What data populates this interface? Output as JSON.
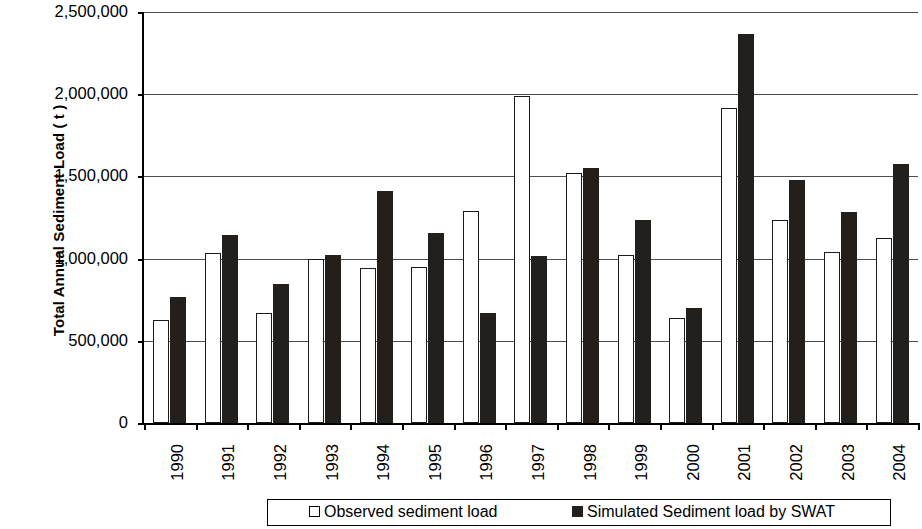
{
  "chart_data": {
    "type": "bar",
    "title": "",
    "subtitle": "",
    "xlabel": "",
    "ylabel": "Total Annual Sediment Load ( t )",
    "ylim": [
      0,
      2500000
    ],
    "ytick_values": [
      0,
      500000,
      1000000,
      1500000,
      2000000,
      2500000
    ],
    "ytick_labels": [
      "0",
      "500,000",
      "1,000,000",
      "1,500,000",
      "2,000,000",
      "2,500,000"
    ],
    "grid": "horizontal",
    "legend_position": "bottom",
    "categories": [
      "1990",
      "1991",
      "1992",
      "1993",
      "1994",
      "1995",
      "1996",
      "1997",
      "1998",
      "1999",
      "2000",
      "2001",
      "2002",
      "2003",
      "2004"
    ],
    "series": [
      {
        "name": "Observed sediment load",
        "color": "#ffffff",
        "edge_color": "#000000",
        "values": [
          627000,
          1035000,
          668000,
          1000000,
          943000,
          950000,
          1290000,
          1992000,
          1521000,
          1024000,
          641000,
          1917000,
          1233000,
          1041000,
          1127000
        ]
      },
      {
        "name": "Simulated Sediment load by SWAT",
        "color": "#231f1c",
        "edge_color": "#231f1c",
        "values": [
          764000,
          1141000,
          847000,
          1021000,
          1411000,
          1156000,
          672000,
          1018000,
          1553000,
          1232000,
          702000,
          2368000,
          1480000,
          1282000,
          1574000
        ]
      }
    ]
  },
  "legend": {
    "items": [
      {
        "label": "Observed sediment load",
        "marker": "open-square-marker"
      },
      {
        "label": "Simulated Sediment load by SWAT",
        "marker": "filled-square-marker"
      }
    ]
  }
}
